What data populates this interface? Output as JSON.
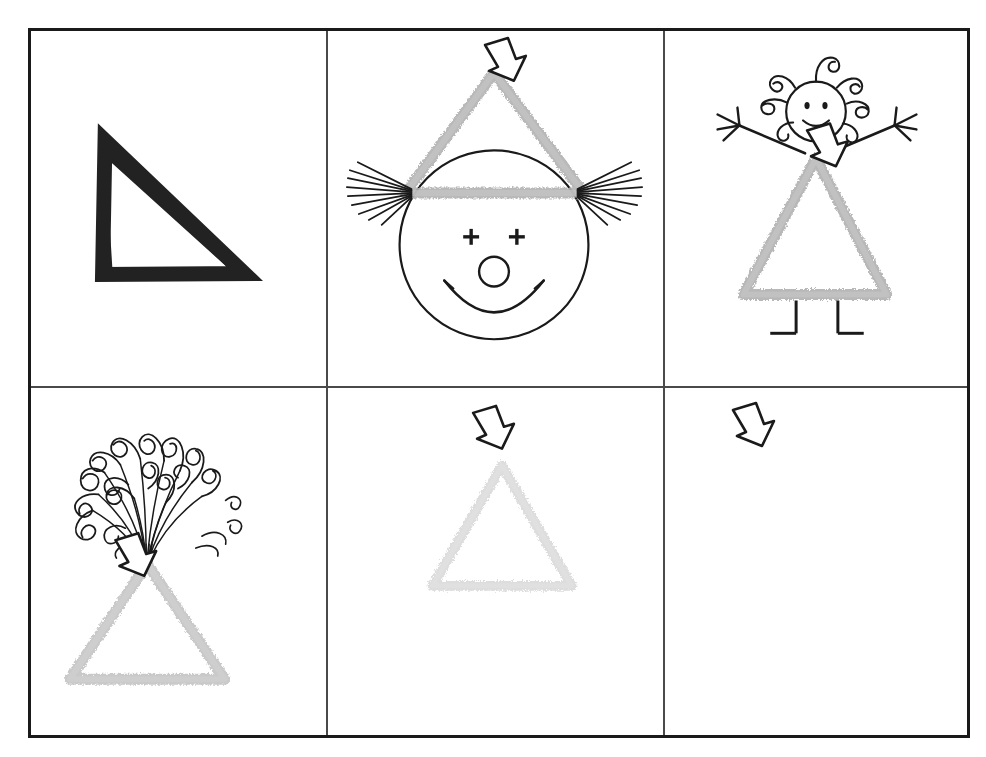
{
  "worksheet": {
    "title": "Triangle Shape Prompt-Fading Worksheet",
    "description": "A two-row by three-column bordered grid of hand-drawn triangle illustrations showing a prompt-fading sequence from a bold solid triangle to a faint triangle to no triangle at all.",
    "border_color": "#1a1a1a",
    "divider_color": "#4a4a4a",
    "background_color": "#ffffff",
    "columns": 3,
    "rows": 2
  },
  "colors": {
    "ink_black": "#1a1a1a",
    "triangle_solid": "#222222",
    "triangle_gray_strong": "#b5b5b5",
    "triangle_gray_medium": "#c9c9c9",
    "triangle_gray_faint": "#dedede",
    "arrow_outline": "#1a1a1a",
    "arrow_fill": "#ffffff"
  },
  "cells": [
    {
      "id": "cell-1",
      "name": "solid-black-triangle",
      "caption": "Bold solid black outlined triangle",
      "triangle": {
        "present": true,
        "style": "solid-black",
        "color": "#222222",
        "stroke_width": 16
      },
      "arrow": {
        "present": false
      },
      "embellishment": "none"
    },
    {
      "id": "cell-2",
      "name": "clown-face-with-party-hat",
      "caption": "Clown face wearing the triangle as a party hat, with fan hair, plus-sign eyes, round nose and a big smile",
      "triangle": {
        "present": true,
        "style": "chalky-gray",
        "color": "#b5b5b5",
        "stroke_width": 11
      },
      "arrow": {
        "present": true,
        "points_to": "triangle-apex",
        "direction": "down-left"
      },
      "embellishment": "clown-face"
    },
    {
      "id": "cell-3",
      "name": "stick-girl-with-triangle-dress",
      "caption": "Stick-figure girl with curly hair, starburst hands and L-shaped legs, wearing the triangle as a dress",
      "triangle": {
        "present": true,
        "style": "chalky-gray",
        "color": "#b5b5b5",
        "stroke_width": 11
      },
      "arrow": {
        "present": true,
        "points_to": "triangle-apex",
        "direction": "down-left"
      },
      "embellishment": "stick-girl"
    },
    {
      "id": "cell-4",
      "name": "bouquet-burst-triangle",
      "caption": "Triangle with a bouquet of curly loops bursting out of its apex",
      "triangle": {
        "present": true,
        "style": "chalky-gray",
        "color": "#c9c9c9",
        "stroke_width": 11
      },
      "arrow": {
        "present": true,
        "points_to": "triangle-apex",
        "direction": "down-left"
      },
      "embellishment": "curly-bouquet"
    },
    {
      "id": "cell-5",
      "name": "faint-triangle-with-arrow",
      "caption": "Very faint gray triangle with the arrow pointing at its apex",
      "triangle": {
        "present": true,
        "style": "chalky-gray",
        "color": "#dedede",
        "stroke_width": 9
      },
      "arrow": {
        "present": true,
        "points_to": "triangle-apex",
        "direction": "down-left"
      },
      "embellishment": "none"
    },
    {
      "id": "cell-6",
      "name": "arrow-only",
      "caption": "Arrow alone with no triangle — the prompt has fully faded",
      "triangle": {
        "present": false
      },
      "arrow": {
        "present": true,
        "points_to": "empty-space",
        "direction": "down-left"
      },
      "embellishment": "none"
    }
  ]
}
